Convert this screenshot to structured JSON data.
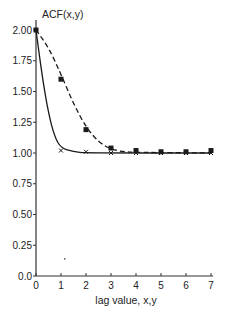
{
  "chart_data": {
    "type": "line",
    "title": "",
    "xlabel": "lag value, x,y",
    "ylabel": "ACF(x,y)",
    "xlim": [
      0,
      7
    ],
    "ylim": [
      0,
      2.0
    ],
    "x_ticks": [
      "0",
      "1",
      "2",
      "3",
      "4",
      "5",
      "6",
      "7"
    ],
    "y_ticks": [
      "0.0",
      "0.25",
      "0.50",
      "0.75",
      "1.00",
      "1.25",
      "1.50",
      "1.75",
      "2.00"
    ],
    "grid": false,
    "legend": null,
    "series": [
      {
        "name": "squares (dashed fit)",
        "marker": "square",
        "line_style": "dashed",
        "x": [
          0,
          1,
          2,
          3,
          4,
          5,
          6,
          7
        ],
        "values": [
          2.0,
          1.6,
          1.19,
          1.04,
          1.02,
          1.01,
          1.01,
          1.02
        ],
        "fit_curve": [
          [
            0,
            2.0
          ],
          [
            0.5,
            1.86
          ],
          [
            1,
            1.64
          ],
          [
            1.5,
            1.4
          ],
          [
            2,
            1.21
          ],
          [
            2.5,
            1.09
          ],
          [
            3,
            1.03
          ],
          [
            3.5,
            1.01
          ],
          [
            4,
            1.005
          ],
          [
            7,
            1.0
          ]
        ]
      },
      {
        "name": "crosses (solid fit)",
        "marker": "cross",
        "line_style": "solid",
        "x": [
          0,
          1,
          2,
          3,
          4,
          5,
          6,
          7
        ],
        "values": [
          2.0,
          1.02,
          1.01,
          1.0,
          1.0,
          1.0,
          1.0,
          1.0
        ],
        "fit_curve": [
          [
            0,
            2.0
          ],
          [
            0.25,
            1.62
          ],
          [
            0.5,
            1.32
          ],
          [
            0.75,
            1.13
          ],
          [
            1,
            1.04
          ],
          [
            1.5,
            1.01
          ],
          [
            2,
            1.0
          ],
          [
            7,
            1.0
          ]
        ]
      }
    ],
    "annotations": [
      {
        "type": "stray-dot",
        "x": 1.15,
        "y": 0.14
      }
    ]
  },
  "style": {
    "line_color": "#1a1a1a",
    "axis_color": "#333333",
    "background": "#ffffff"
  }
}
